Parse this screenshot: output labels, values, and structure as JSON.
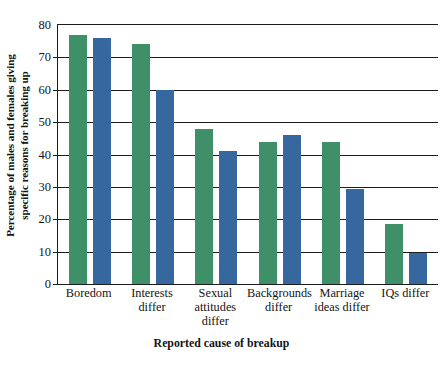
{
  "chart_data": {
    "type": "bar",
    "title": "",
    "subtitle": "",
    "xlabel": "Reported cause of breakup",
    "ylabel": "Percentage of males and females giving specific reasons for breaking up",
    "ylabel_line1": "Percentage of males and females giving",
    "ylabel_line2": "specific reasons for breaking up",
    "categories": [
      "Boredom",
      "Interests differ",
      "Sexual attitudes differ",
      "Backgrounds differ",
      "Marriage ideas differ",
      "IQs differ"
    ],
    "category_lines": [
      [
        "Boredom"
      ],
      [
        "Interests",
        "differ"
      ],
      [
        "Sexual",
        "attitudes",
        "differ"
      ],
      [
        "Backgrounds",
        "differ"
      ],
      [
        "Marriage",
        "ideas differ"
      ],
      [
        "IQs differ"
      ]
    ],
    "series": [
      {
        "name": "Males",
        "color": "#3f9069",
        "values": [
          77,
          74,
          48,
          44,
          44,
          18.5
        ]
      },
      {
        "name": "Females",
        "color": "#37679f",
        "values": [
          76,
          60,
          41,
          46,
          29.5,
          9.5
        ]
      }
    ],
    "ylim": [
      0,
      80
    ],
    "yticks": [
      0,
      10,
      20,
      30,
      40,
      50,
      60,
      70,
      80
    ],
    "ytick_labels": [
      "0",
      "10",
      "20",
      "30",
      "40",
      "50",
      "60",
      "70",
      "80"
    ],
    "grid": true,
    "grid_axis": "y",
    "legend": "none",
    "axis_color": "#1c1c1c",
    "background_color": "#ffffff"
  }
}
